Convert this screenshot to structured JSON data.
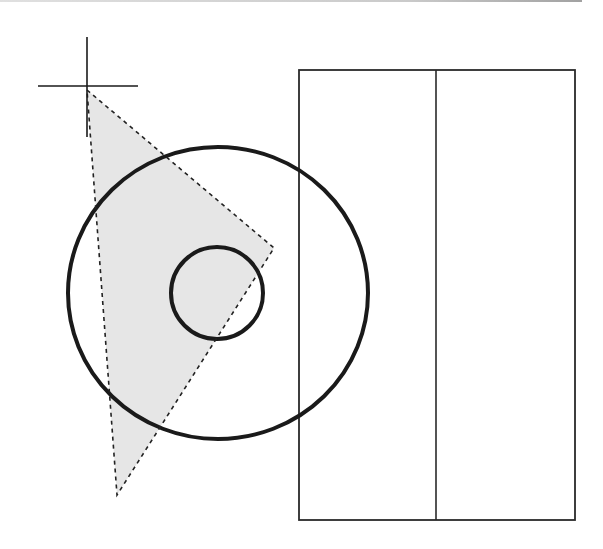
{
  "figure": {
    "colors": {
      "background": "#ffffff",
      "stroke": "#1a1a1a",
      "selection_fill": "#e6e6e6",
      "selection_stroke": "#222222",
      "rectangle_stroke": "#2a2a2a"
    },
    "crosshair": {
      "center": [
        87,
        87
      ],
      "horizontal": [
        38,
        138
      ],
      "vertical": [
        37,
        137
      ]
    },
    "selection_triangle": {
      "points": [
        [
          87,
          90
        ],
        [
          274,
          248
        ],
        [
          117,
          495
        ]
      ],
      "style": "dashed"
    },
    "outer_circle": {
      "cx": 218,
      "cy": 293,
      "rx": 150,
      "ry": 146
    },
    "inner_circle": {
      "cx": 217,
      "cy": 293,
      "r": 46
    },
    "rectangle": {
      "x": 299,
      "y": 70,
      "width": 276,
      "height": 450,
      "divider_x": 436
    }
  }
}
